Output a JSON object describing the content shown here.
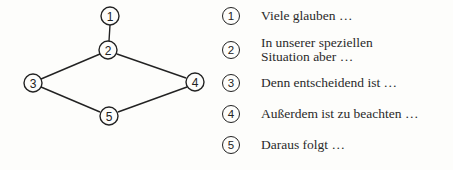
{
  "diagram": {
    "nodes": [
      {
        "id": "1",
        "label": "1",
        "x": 110,
        "y": 16
      },
      {
        "id": "2",
        "label": "2",
        "x": 108,
        "y": 50
      },
      {
        "id": "3",
        "label": "3",
        "x": 33,
        "y": 83
      },
      {
        "id": "4",
        "label": "4",
        "x": 195,
        "y": 82
      },
      {
        "id": "5",
        "label": "5",
        "x": 109,
        "y": 116
      }
    ],
    "edges": [
      {
        "from": "1",
        "to": "2"
      },
      {
        "from": "2",
        "to": "3"
      },
      {
        "from": "2",
        "to": "4"
      },
      {
        "from": "3",
        "to": "5"
      },
      {
        "from": "4",
        "to": "5"
      }
    ]
  },
  "legend": {
    "items": [
      {
        "number": "1",
        "lines": [
          "Viele glauben …"
        ]
      },
      {
        "number": "2",
        "lines": [
          "In unserer speziellen",
          "Situation aber …"
        ]
      },
      {
        "number": "3",
        "lines": [
          "Denn entscheidend ist …"
        ]
      },
      {
        "number": "4",
        "lines": [
          "Außerdem ist zu beachten …"
        ]
      },
      {
        "number": "5",
        "lines": [
          "Daraus folgt …"
        ]
      }
    ]
  },
  "colors": {
    "stroke": "#222222",
    "background": "#fdfdfb",
    "text": "#2a2a2a"
  }
}
